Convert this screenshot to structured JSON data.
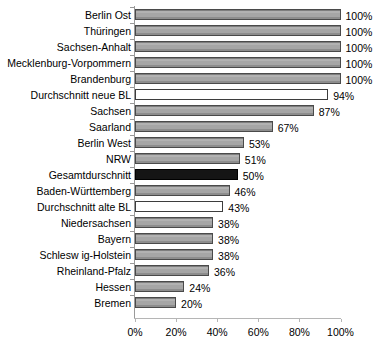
{
  "chart_data": {
    "type": "bar",
    "orientation": "horizontal",
    "title": "",
    "subtitle": "",
    "xlabel": "",
    "ylabel": "",
    "xlim": [
      0,
      100
    ],
    "grid": false,
    "legend": null,
    "value_suffix": "%",
    "axis": {
      "ticks": [
        0,
        20,
        40,
        60,
        80,
        100
      ],
      "tick_labels": [
        "0%",
        "20%",
        "40%",
        "60%",
        "80%",
        "100%"
      ]
    },
    "colors": {
      "bar_gray": "#a6a6a6",
      "bar_black": "#151515",
      "bar_white": "#ffffff",
      "bar_border": "#4a4a4a",
      "axis": "#9a9a9a",
      "text": "#000000",
      "background": "#ffffff"
    },
    "categories": [
      "Berlin Ost",
      "Thüringen",
      "Sachsen-Anhalt",
      "Mecklenburg-Vorpommern",
      "Brandenburg",
      "Durchschnitt neue BL",
      "Sachsen",
      "Saarland",
      "Berlin West",
      "NRW",
      "Gesamtdurschnitt",
      "Baden-Württemberg",
      "Durchschnitt alte BL",
      "Niedersachsen",
      "Bayern",
      "Schlesw ig-Holstein",
      "Rheinland-Pfalz",
      "Hessen",
      "Bremen"
    ],
    "values": [
      100,
      100,
      100,
      100,
      100,
      94,
      87,
      67,
      53,
      51,
      50,
      46,
      43,
      38,
      38,
      38,
      36,
      24,
      20
    ],
    "data_labels": [
      "100%",
      "100%",
      "100%",
      "100%",
      "100%",
      "94%",
      "87%",
      "67%",
      "53%",
      "51%",
      "50%",
      "46%",
      "43%",
      "38%",
      "38%",
      "38%",
      "36%",
      "24%",
      "20%"
    ],
    "bar_styles": [
      "gray",
      "gray",
      "gray",
      "gray",
      "gray",
      "white",
      "gray",
      "gray",
      "gray",
      "gray",
      "black",
      "gray",
      "white",
      "gray",
      "gray",
      "gray",
      "gray",
      "gray",
      "gray"
    ],
    "rows": [
      {
        "label": "Berlin Ost",
        "value": 100,
        "data_label": "100%",
        "style": "gray"
      },
      {
        "label": "Thüringen",
        "value": 100,
        "data_label": "100%",
        "style": "gray"
      },
      {
        "label": "Sachsen-Anhalt",
        "value": 100,
        "data_label": "100%",
        "style": "gray"
      },
      {
        "label": "Mecklenburg-Vorpommern",
        "value": 100,
        "data_label": "100%",
        "style": "gray"
      },
      {
        "label": "Brandenburg",
        "value": 100,
        "data_label": "100%",
        "style": "gray"
      },
      {
        "label": "Durchschnitt neue BL",
        "value": 94,
        "data_label": "94%",
        "style": "white"
      },
      {
        "label": "Sachsen",
        "value": 87,
        "data_label": "87%",
        "style": "gray"
      },
      {
        "label": "Saarland",
        "value": 67,
        "data_label": "67%",
        "style": "gray"
      },
      {
        "label": "Berlin West",
        "value": 53,
        "data_label": "53%",
        "style": "gray"
      },
      {
        "label": "NRW",
        "value": 51,
        "data_label": "51%",
        "style": "gray"
      },
      {
        "label": "Gesamtdurschnitt",
        "value": 50,
        "data_label": "50%",
        "style": "black"
      },
      {
        "label": "Baden-Württemberg",
        "value": 46,
        "data_label": "46%",
        "style": "gray"
      },
      {
        "label": "Durchschnitt alte BL",
        "value": 43,
        "data_label": "43%",
        "style": "white"
      },
      {
        "label": "Niedersachsen",
        "value": 38,
        "data_label": "38%",
        "style": "gray"
      },
      {
        "label": "Bayern",
        "value": 38,
        "data_label": "38%",
        "style": "gray"
      },
      {
        "label": "Schlesw ig-Holstein",
        "value": 38,
        "data_label": "38%",
        "style": "gray"
      },
      {
        "label": "Rheinland-Pfalz",
        "value": 36,
        "data_label": "36%",
        "style": "gray"
      },
      {
        "label": "Hessen",
        "value": 24,
        "data_label": "24%",
        "style": "gray"
      },
      {
        "label": "Bremen",
        "value": 20,
        "data_label": "20%",
        "style": "gray"
      }
    ]
  }
}
